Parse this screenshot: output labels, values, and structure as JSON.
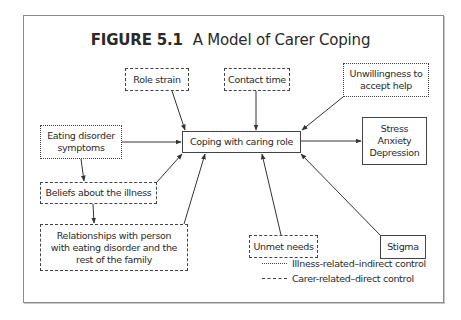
{
  "figure": {
    "number_label": "FIGURE 5.1",
    "title": "A Model of Carer Coping"
  },
  "nodes": {
    "role_strain": {
      "label": "Role strain",
      "style": "dashed"
    },
    "contact_time": {
      "label": "Contact time",
      "style": "dashed"
    },
    "unwillingness": {
      "label": "Unwillingness to accept help",
      "style": "dotted"
    },
    "eating_disorder": {
      "label": "Eating disorder symptoms",
      "style": "dotted"
    },
    "coping": {
      "label": "Coping with caring role",
      "style": "solid"
    },
    "outcomes": {
      "label": "Stress Anxiety Depression",
      "style": "solid"
    },
    "beliefs": {
      "label": "Beliefs about the illness",
      "style": "dashed"
    },
    "relationships": {
      "label": "Relationships with person with eating disorder and the rest of the family",
      "style": "dashed"
    },
    "unmet_needs": {
      "label": "Unmet needs",
      "style": "dashed"
    },
    "stigma": {
      "label": "Stigma",
      "style": "solid"
    }
  },
  "edges": [
    {
      "from": "Role strain",
      "to": "Coping with caring role"
    },
    {
      "from": "Contact time",
      "to": "Coping with caring role"
    },
    {
      "from": "Unwillingness to accept help",
      "to": "Coping with caring role"
    },
    {
      "from": "Eating disorder symptoms",
      "to": "Coping with caring role"
    },
    {
      "from": "Eating disorder symptoms",
      "to": "Beliefs about the illness"
    },
    {
      "from": "Beliefs about the illness",
      "to": "Coping with caring role"
    },
    {
      "from": "Beliefs about the illness",
      "to": "Relationships with person with eating disorder and the rest of the family"
    },
    {
      "from": "Relationships with person with eating disorder and the rest of the family",
      "to": "Coping with caring role"
    },
    {
      "from": "Unmet needs",
      "to": "Coping with caring role"
    },
    {
      "from": "Stigma",
      "to": "Coping with caring role"
    },
    {
      "from": "Coping with caring role",
      "to": "Stress Anxiety Depression"
    }
  ],
  "legend": {
    "dotted": "Illness-related–indirect control",
    "dashed": "Carer-related–direct control"
  },
  "colors": {
    "line": "#444444",
    "frame": "#8a8a8a",
    "text": "#2a2a2a",
    "background": "#ffffff"
  }
}
